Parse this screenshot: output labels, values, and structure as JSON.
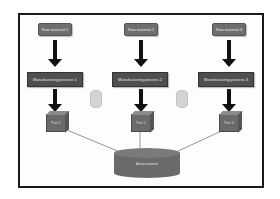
{
  "diagram": {
    "type": "manufacturing-flow",
    "raw_materials": [
      {
        "label": "Raw material 1"
      },
      {
        "label": "Raw material 2"
      },
      {
        "label": "Raw material 3"
      }
    ],
    "processes": [
      {
        "label": "Manufacturing process 1"
      },
      {
        "label": "Manufacturing process 2"
      },
      {
        "label": "Manufacturing process 3"
      }
    ],
    "parts": [
      {
        "label": "Part 1"
      },
      {
        "label": "Part 2"
      },
      {
        "label": "Part 3"
      }
    ],
    "side_resources": [
      {
        "icon": "cylinder-icon"
      },
      {
        "icon": "cylinder-icon"
      }
    ],
    "target": {
      "label": "Assessment",
      "icon": "database-icon"
    },
    "colors": {
      "box_fill": "#6e6e6e",
      "process_fill": "#4f4f4f",
      "arrow": "#111111",
      "frame_border": "#1a1a1a",
      "connector": "#7a7a7a"
    }
  }
}
